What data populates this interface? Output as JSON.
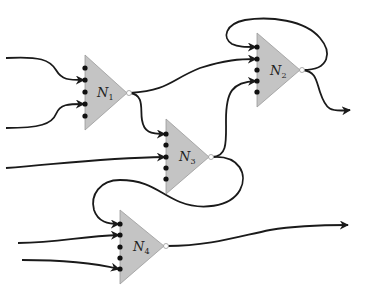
{
  "diagram": {
    "type": "neural network of threshold units",
    "neurons": [
      {
        "id": "N1",
        "label": "N",
        "subscript": "1",
        "inputs_connected": [
          2,
          4
        ],
        "num_input_dots": 5
      },
      {
        "id": "N2",
        "label": "N",
        "subscript": "2",
        "inputs_connected": [
          1,
          2,
          4
        ],
        "num_input_dots": 5
      },
      {
        "id": "N3",
        "label": "N",
        "subscript": "3",
        "inputs_connected": [
          1,
          3
        ],
        "num_input_dots": 5
      },
      {
        "id": "N4",
        "label": "N",
        "subscript": "4",
        "inputs_connected": [
          1,
          2,
          5
        ],
        "num_input_dots": 5
      }
    ],
    "connections": [
      {
        "from": "external",
        "to": "N1",
        "input": 2
      },
      {
        "from": "external",
        "to": "N1",
        "input": 4
      },
      {
        "from": "N1",
        "to": "N2",
        "input": 2
      },
      {
        "from": "N1",
        "to": "N3",
        "input": 1
      },
      {
        "from": "N2",
        "to": "N2",
        "input": 1,
        "note": "self-loop"
      },
      {
        "from": "N2",
        "to": "output"
      },
      {
        "from": "external",
        "to": "N3",
        "input": 3
      },
      {
        "from": "N3",
        "to": "N2",
        "input": 4
      },
      {
        "from": "N3",
        "to": "N4",
        "input": 1
      },
      {
        "from": "external",
        "to": "N4",
        "input": 2
      },
      {
        "from": "external",
        "to": "N4",
        "input": 5
      },
      {
        "from": "N4",
        "to": "output"
      }
    ],
    "colors": {
      "neuron_fill": "#c4c4c4",
      "wire": "#1a1a1a",
      "dot": "#111111"
    }
  }
}
